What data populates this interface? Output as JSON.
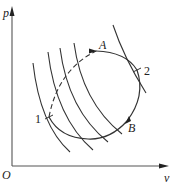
{
  "diagram": {
    "title": "",
    "axes": {
      "y_label": "p",
      "x_label": "v",
      "origin_label": "O"
    },
    "points": [
      {
        "label": "1"
      },
      {
        "label": "2"
      },
      {
        "label": "A"
      },
      {
        "label": "B"
      }
    ],
    "colors": {
      "line": "#333333",
      "background": "#ffffff"
    }
  }
}
